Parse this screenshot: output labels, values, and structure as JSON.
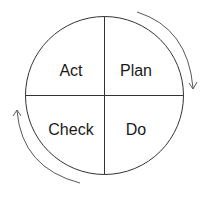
{
  "diagram": {
    "quadrants": [
      {
        "position": "top-left",
        "label": "Act"
      },
      {
        "position": "top-right",
        "label": "Plan"
      },
      {
        "position": "bottom-left",
        "label": "Check"
      },
      {
        "position": "bottom-right",
        "label": "Do"
      }
    ],
    "arrows": [
      {
        "position": "top-right",
        "direction": "clockwise"
      },
      {
        "position": "bottom-left",
        "direction": "clockwise"
      }
    ],
    "colors": {
      "stroke": "#333333",
      "text": "#1a1a1a",
      "background": "#ffffff"
    }
  }
}
